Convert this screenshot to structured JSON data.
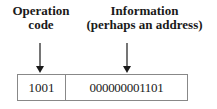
{
  "labels": {
    "opcode": [
      "Operation",
      "code"
    ],
    "info": [
      "Information",
      "(perhaps an address)"
    ]
  },
  "word": {
    "opcode_bits": "1001",
    "address_bits": "000000001101"
  },
  "colors": {
    "line": "#1a1a1a",
    "border": "#888888"
  }
}
